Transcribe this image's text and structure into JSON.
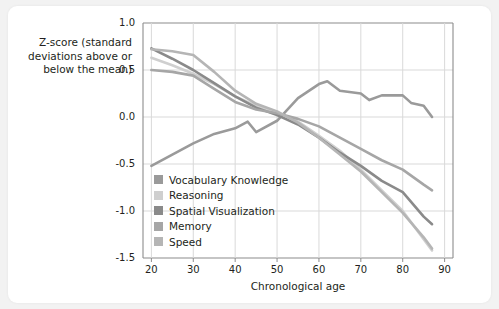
{
  "chart_data": {
    "type": "line",
    "title": "",
    "xlabel": "Chronological age",
    "ylabel": "Z-score (standard deviations above or below the mean)",
    "xlim": [
      18,
      92
    ],
    "ylim": [
      -1.5,
      1.0
    ],
    "xticks": [
      20,
      30,
      40,
      50,
      60,
      70,
      80,
      90
    ],
    "yticks": [
      -1.5,
      -1.0,
      -0.5,
      0.0,
      0.5,
      1.0
    ],
    "ytick_labels": [
      "-1.5",
      "-1.0",
      "-0.5",
      "0.0",
      "0.5",
      "1.0"
    ],
    "xtick_labels": [
      "20",
      "30",
      "40",
      "50",
      "60",
      "70",
      "80",
      "90"
    ],
    "grid": true,
    "legend_position": "inside-lower-left",
    "series": [
      {
        "name": "Vocabulary Knowledge",
        "color": "#9a9a9a",
        "x": [
          20,
          25,
          30,
          35,
          40,
          43,
          45,
          50,
          55,
          60,
          62,
          65,
          70,
          72,
          75,
          80,
          82,
          85,
          87
        ],
        "values": [
          -0.52,
          -0.4,
          -0.28,
          -0.18,
          -0.12,
          -0.05,
          -0.16,
          -0.04,
          0.2,
          0.35,
          0.38,
          0.28,
          0.25,
          0.18,
          0.23,
          0.23,
          0.15,
          0.12,
          0.0
        ]
      },
      {
        "name": "Reasoning",
        "color": "#cfcfcf",
        "x": [
          20,
          25,
          30,
          35,
          40,
          45,
          50,
          55,
          60,
          65,
          70,
          75,
          80,
          85,
          87
        ],
        "values": [
          0.63,
          0.55,
          0.46,
          0.35,
          0.22,
          0.12,
          0.05,
          -0.05,
          -0.2,
          -0.36,
          -0.56,
          -0.78,
          -1.0,
          -1.3,
          -1.42
        ]
      },
      {
        "name": "Spatial Visualization",
        "color": "#8a8a8a",
        "x": [
          20,
          25,
          30,
          35,
          40,
          45,
          50,
          55,
          60,
          65,
          70,
          75,
          80,
          85,
          87
        ],
        "values": [
          0.73,
          0.62,
          0.5,
          0.36,
          0.22,
          0.1,
          0.02,
          -0.08,
          -0.22,
          -0.38,
          -0.52,
          -0.68,
          -0.8,
          -1.06,
          -1.14
        ]
      },
      {
        "name": "Memory",
        "color": "#a6a6a6",
        "x": [
          20,
          25,
          30,
          35,
          40,
          45,
          50,
          55,
          60,
          65,
          70,
          75,
          80,
          85,
          87
        ],
        "values": [
          0.5,
          0.48,
          0.44,
          0.3,
          0.16,
          0.08,
          0.04,
          -0.02,
          -0.1,
          -0.22,
          -0.34,
          -0.46,
          -0.56,
          -0.72,
          -0.78
        ]
      },
      {
        "name": "Speed",
        "color": "#b5b5b5",
        "x": [
          20,
          25,
          30,
          35,
          40,
          45,
          50,
          55,
          60,
          65,
          70,
          75,
          80,
          85,
          87
        ],
        "values": [
          0.72,
          0.7,
          0.66,
          0.48,
          0.28,
          0.14,
          0.06,
          -0.06,
          -0.22,
          -0.4,
          -0.58,
          -0.8,
          -1.02,
          -1.28,
          -1.4
        ]
      }
    ]
  },
  "legend": {
    "items": [
      {
        "label": "Vocabulary Knowledge",
        "color": "#9a9a9a"
      },
      {
        "label": "Reasoning",
        "color": "#cfcfcf"
      },
      {
        "label": "Spatial Visualization",
        "color": "#8a8a8a"
      },
      {
        "label": "Memory",
        "color": "#a6a6a6"
      },
      {
        "label": "Speed",
        "color": "#b5b5b5"
      }
    ]
  },
  "axis": {
    "y_title_line1": "Z-score (standard",
    "y_title_line2": "deviations above or",
    "y_title_line3": "below the mean)",
    "x_title": "Chronological age"
  },
  "colors": {
    "background": "#f2f2f2",
    "card": "#ffffff",
    "axis_line": "#8c8c8c",
    "grid_line": "#d9d9d9",
    "text": "#231f20"
  }
}
